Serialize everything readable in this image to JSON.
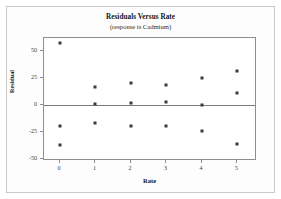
{
  "chart_data": {
    "type": "scatter",
    "title": "Residuals Versus Rate",
    "subtitle": "(response is Cadmium)",
    "xlabel": "Rate",
    "ylabel": "Residual",
    "xlim": [
      -0.45,
      5.55
    ],
    "ylim": [
      -52,
      62
    ],
    "xticks": [
      0,
      1,
      2,
      3,
      4,
      5
    ],
    "xtick_labels": [
      "0",
      "1",
      "2",
      "3",
      "4",
      "5"
    ],
    "yticks": [
      50,
      25,
      0,
      -25,
      -50
    ],
    "ytick_labels": [
      "50",
      "25",
      "0",
      "-25",
      "-50"
    ],
    "grid": false,
    "legend": null,
    "reference_line": {
      "axis": "y",
      "value": 0
    },
    "marker": {
      "shape": "square",
      "color": "#3a3a3a",
      "size": 3
    },
    "points": [
      {
        "x": 0,
        "y": 57
      },
      {
        "x": 0,
        "y": -20
      },
      {
        "x": 0,
        "y": -37
      },
      {
        "x": 1,
        "y": 17
      },
      {
        "x": 1,
        "y": 1
      },
      {
        "x": 1,
        "y": -17
      },
      {
        "x": 2,
        "y": 20
      },
      {
        "x": 2,
        "y": 2
      },
      {
        "x": 2,
        "y": -20
      },
      {
        "x": 3,
        "y": 18
      },
      {
        "x": 3,
        "y": 3
      },
      {
        "x": 3,
        "y": -20
      },
      {
        "x": 4,
        "y": 25
      },
      {
        "x": 4,
        "y": 0
      },
      {
        "x": 4,
        "y": -24
      },
      {
        "x": 5,
        "y": 31
      },
      {
        "x": 5,
        "y": 11
      },
      {
        "x": 5,
        "y": -36
      }
    ],
    "colors": {
      "marker": "#3a3a3a",
      "axis": "#8e8e8e",
      "zero_line": "#7a7a7a",
      "frame": "#c9c9c9",
      "background": "#ffffff"
    }
  }
}
